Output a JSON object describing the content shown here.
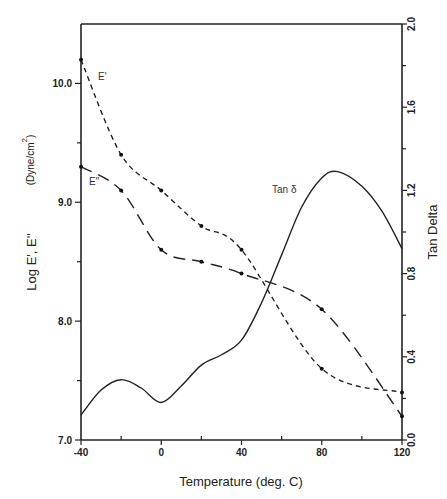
{
  "chart_data": {
    "type": "line",
    "title": "",
    "xlabel": "Temperature (deg. C)",
    "ylabel": "Log E', E''",
    "ylabel_units": "(Dyne/cm",
    "ylabel_units_sup": "2",
    "ylabel_units_close": ")",
    "y2label": "Tan Delta",
    "xlim": [
      -40,
      120
    ],
    "ylim": [
      7.0,
      10.5
    ],
    "y2lim": [
      0.0,
      2.0
    ],
    "xticks": [
      -40,
      0,
      40,
      80,
      120
    ],
    "xtick_labels": [
      "-40",
      "0",
      "40",
      "80",
      "120"
    ],
    "xminor_ticks": [
      -20,
      20,
      60,
      100
    ],
    "yticks": [
      7.0,
      8.0,
      9.0,
      10.0
    ],
    "ytick_labels": [
      "7.0",
      "8.0",
      "9.0",
      "10.0"
    ],
    "yminor_ticks": [
      7.5,
      8.5,
      9.5
    ],
    "y2ticks": [
      0.0,
      0.4,
      0.8,
      1.2,
      1.6,
      2.0
    ],
    "y2tick_labels": [
      "0.0",
      "0.4",
      "0.8",
      "1.2",
      "1.6",
      "2.0"
    ],
    "y2minor_ticks": [
      0.2,
      0.6,
      1.0,
      1.4,
      1.8
    ],
    "grid": false,
    "legend": "inline labels",
    "series": [
      {
        "name": "E'",
        "label": "E'",
        "axis": "left",
        "style": "short-dash",
        "markers": true,
        "x": [
          -40,
          -20,
          0,
          20,
          40,
          80,
          120
        ],
        "values": [
          10.2,
          9.4,
          9.1,
          8.8,
          8.6,
          7.6,
          7.4
        ]
      },
      {
        "name": "E''",
        "label": "E\"",
        "axis": "left",
        "style": "long-dash",
        "markers": true,
        "x": [
          -40,
          -20,
          0,
          20,
          40,
          80,
          120
        ],
        "values": [
          9.3,
          9.1,
          8.6,
          8.5,
          8.4,
          8.1,
          7.2
        ]
      },
      {
        "name": "Tan δ",
        "label": "Tan  δ",
        "axis": "right",
        "style": "solid",
        "markers": false,
        "x": [
          -40,
          -30,
          -20,
          -10,
          0,
          10,
          20,
          30,
          40,
          50,
          60,
          70,
          80,
          88,
          100,
          110,
          120
        ],
        "values": [
          0.12,
          0.24,
          0.29,
          0.25,
          0.18,
          0.26,
          0.36,
          0.41,
          0.48,
          0.66,
          0.89,
          1.12,
          1.26,
          1.29,
          1.22,
          1.1,
          0.92
        ]
      }
    ]
  }
}
